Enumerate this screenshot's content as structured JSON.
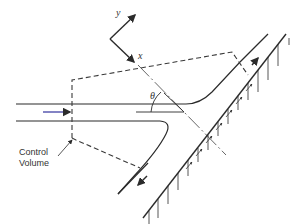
{
  "diagram": {
    "type": "jet impinging on inclined plate with control volume",
    "labels": {
      "y_axis": "y",
      "x_axis": "x",
      "angle": "θ",
      "control_volume_line1": "Control",
      "control_volume_line2": "Volume",
      "corner_mark": "l"
    },
    "colors": {
      "line": "#2b2b2b",
      "dashed": "#3a3a3a",
      "inflow_arrow": "#5a5ab0",
      "background": "#ffffff"
    }
  }
}
